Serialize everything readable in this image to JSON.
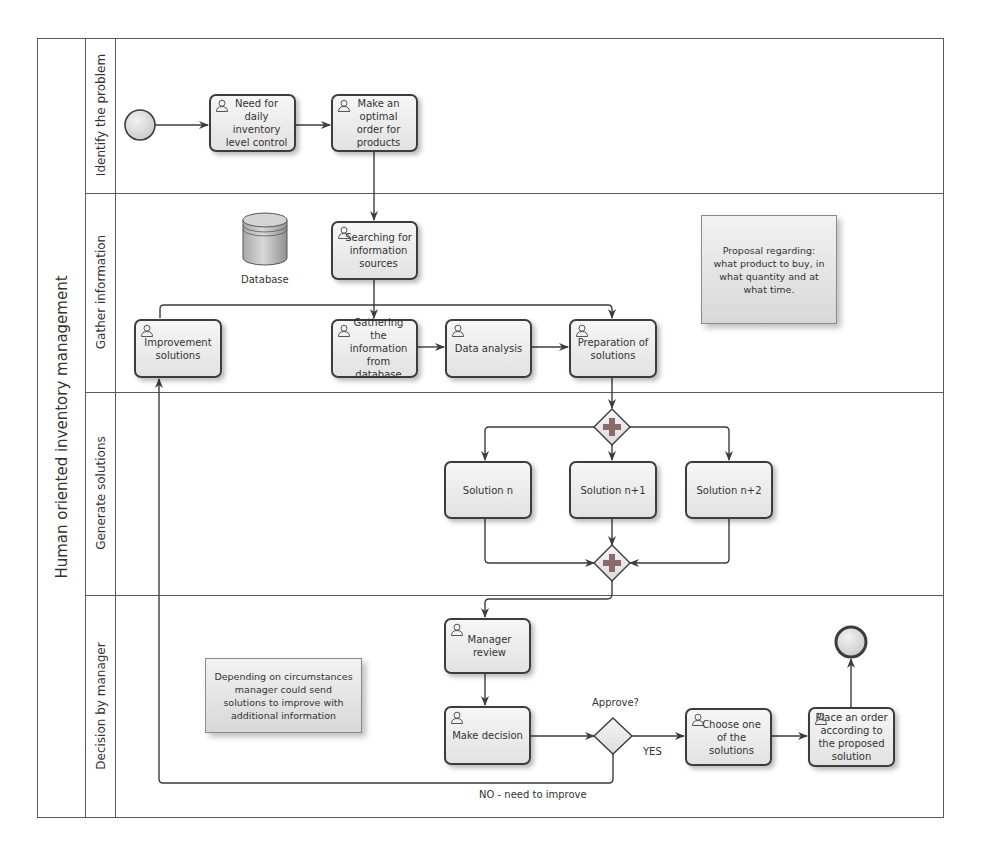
{
  "pool": {
    "title": "Human oriented inventory management"
  },
  "lanes": [
    {
      "id": "identify",
      "label": "Identify the problem"
    },
    {
      "id": "gather",
      "label": "Gather information"
    },
    {
      "id": "generate",
      "label": "Generate solutions"
    },
    {
      "id": "decision",
      "label": "Decision by manager"
    }
  ],
  "tasks": {
    "need_control": "Need for daily inventory level control",
    "make_order": "Make an optimal order for products",
    "searching": "Searching for information sources",
    "improvement": "Improvement solutions",
    "gathering": "Gathering the information from database",
    "data_analysis": "Data analysis",
    "preparation": "Preparation of solutions",
    "solution_n": "Solution n",
    "solution_n1": "Solution n+1",
    "solution_n2": "Solution n+2",
    "manager_review": "Manager review",
    "make_decision": "Make decision",
    "choose_one": "Choose one of the solutions",
    "place_order": "Place an order according to the proposed solution"
  },
  "data_store": {
    "label": "Database"
  },
  "annotations": {
    "proposal": "Proposal regarding: what product to buy, in what quantity and at what time.",
    "depending": "Depending on circumstances manager could send solutions to improve with additional information"
  },
  "gateways": {
    "approve_label": "Approve?",
    "yes_label": "YES",
    "no_label": "NO - need to improve"
  },
  "colors": {
    "stroke": "#3c3c3c",
    "task_fill_top": "#f6f6f6",
    "task_fill_bottom": "#e2e2e2",
    "gateway_plus": "#8a6a6a",
    "event_fill": "#d8d8d8"
  }
}
